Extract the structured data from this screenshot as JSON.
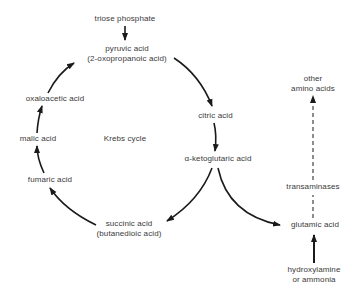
{
  "diagram": {
    "title": "Krebs cycle",
    "nodes": {
      "triose_phosphate": "triose phosphate",
      "pyruvic_acid": {
        "line1": "pyruvic acid",
        "line2": "(2-oxopropanoic acid)"
      },
      "citric_acid": "citric acid",
      "alpha_ketoglutaric_acid": "α-ketoglutaric acid",
      "succinic_acid": {
        "line1": "succinic acid",
        "line2": "(butanedioic acid)"
      },
      "fumaric_acid": "fumaric acid",
      "malic_acid": "malic acid",
      "oxaloacetic_acid": "oxaloacetic acid",
      "glutamic_acid": "glutamic acid",
      "other_amino_acids": {
        "line1": "other",
        "line2": "amino acids"
      },
      "transaminases": "transaminases",
      "hydroxylamine": {
        "line1": "hydroxylamine",
        "line2": "or ammonia"
      }
    },
    "edges": [
      {
        "from": "triose phosphate",
        "to": "pyruvic acid",
        "style": "solid"
      },
      {
        "from": "pyruvic acid",
        "to": "citric acid",
        "style": "solid"
      },
      {
        "from": "citric acid",
        "to": "α-ketoglutaric acid",
        "style": "solid"
      },
      {
        "from": "α-ketoglutaric acid",
        "to": "succinic acid",
        "style": "solid"
      },
      {
        "from": "α-ketoglutaric acid",
        "to": "glutamic acid",
        "style": "solid"
      },
      {
        "from": "succinic acid",
        "to": "fumaric acid",
        "style": "solid"
      },
      {
        "from": "fumaric acid",
        "to": "malic acid",
        "style": "solid"
      },
      {
        "from": "malic acid",
        "to": "oxaloacetic acid",
        "style": "solid"
      },
      {
        "from": "oxaloacetic acid",
        "to": "pyruvic acid",
        "style": "solid"
      },
      {
        "from": "hydroxylamine or ammonia",
        "to": "glutamic acid",
        "style": "solid"
      },
      {
        "from": "glutamic acid",
        "to": "other amino acids",
        "style": "dashed",
        "label": "transaminases"
      }
    ],
    "colors": {
      "line": "#1a1a1a",
      "text": "#3a3a3a",
      "background": "#ffffff"
    }
  }
}
